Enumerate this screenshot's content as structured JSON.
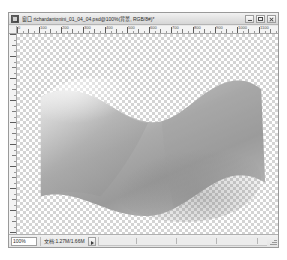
{
  "window": {
    "title": "窗口 richardantonini_01_04_04.psd@100%(背景, RGB/8#)*",
    "icon_name": "photoshop-document-icon",
    "buttons": {
      "minimize_label": "最小化",
      "maximize_label": "最大化",
      "close_label": "关闭"
    }
  },
  "rulers": {
    "unit": "px",
    "horizontal_labels": [
      "0",
      "100",
      "200",
      "300",
      "400",
      "500",
      "600",
      "700",
      "800",
      "900",
      "1000",
      "1100"
    ],
    "horizontal_spacing_px": 22,
    "vertical_spacing_px": 22
  },
  "canvas": {
    "background": "transparency-checkerboard",
    "checker_light": "#ffffff",
    "checker_dark": "#d4d4d4",
    "artwork_name": "waving-plane-gradient-mesh",
    "artwork_fill_light": "#f2f2f2",
    "artwork_fill_mid": "#b9b9b9",
    "artwork_fill_dark": "#8a8a8a"
  },
  "statusbar": {
    "zoom_value": "100%",
    "doc_info": "文档:1.27M/1.66M",
    "expand_label": "▶"
  }
}
